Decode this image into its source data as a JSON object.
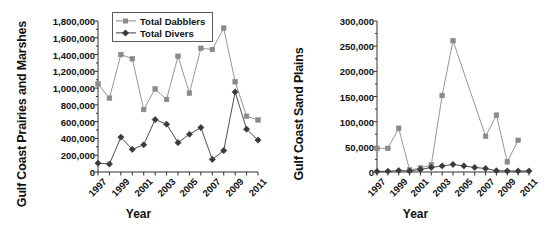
{
  "figure": {
    "panels": [
      {
        "id": "gulf-coast-prairies-and-marshes",
        "ylabel": "Gulf Coast Prairies and Marshes",
        "xlabel": "Year"
      },
      {
        "id": "gulf-coast-sand-plains",
        "ylabel": "Gulf Coast Sand Plains",
        "xlabel": "Year"
      }
    ],
    "legend": {
      "position": "top-left-inside-left-panel",
      "entries": [
        {
          "label": "Total Dabblers",
          "color": "#8a8a8a"
        },
        {
          "label": "Total Divers",
          "color": "#3a3a3a"
        }
      ]
    }
  },
  "chart_data": [
    {
      "type": "line",
      "title": "",
      "xlabel": "Year",
      "ylabel": "Gulf Coast Prairies and Marshes",
      "x": [
        1997,
        1998,
        1999,
        2000,
        2001,
        2002,
        2003,
        2004,
        2005,
        2006,
        2007,
        2008,
        2009,
        2010,
        2011
      ],
      "xtick_labels": [
        "1997",
        "",
        "1999",
        "",
        "2001",
        "",
        "2003",
        "",
        "2005",
        "",
        "2007",
        "",
        "2009",
        "",
        "2011"
      ],
      "xlim": [
        1997,
        2011
      ],
      "ylim": [
        0,
        1800000
      ],
      "ytick_labels": [
        "0",
        "200,000",
        "400,000",
        "600,000",
        "800,000",
        "1,000,000",
        "1,200,000",
        "1,400,000",
        "1,600,000",
        "1,800,000"
      ],
      "yticks": [
        0,
        200000,
        400000,
        600000,
        800000,
        1000000,
        1200000,
        1400000,
        1600000,
        1800000
      ],
      "grid": false,
      "legend_position": "upper left",
      "series": [
        {
          "name": "Total Dabblers",
          "color": "#8a8a8a",
          "marker": "square",
          "values": [
            1050000,
            880000,
            1400000,
            1350000,
            745000,
            990000,
            865000,
            1380000,
            940000,
            1475000,
            1460000,
            1715000,
            1075000,
            665000,
            620000
          ]
        },
        {
          "name": "Total Divers",
          "color": "#3a3a3a",
          "marker": "diamond",
          "values": [
            105000,
            95000,
            415000,
            270000,
            325000,
            625000,
            570000,
            350000,
            450000,
            530000,
            150000,
            255000,
            955000,
            510000,
            380000
          ]
        }
      ]
    },
    {
      "type": "line",
      "title": "",
      "xlabel": "Year",
      "ylabel": "Gulf Coast Sand Plains",
      "x": [
        1997,
        1998,
        1999,
        2000,
        2001,
        2002,
        2003,
        2004,
        2005,
        2006,
        2007,
        2008,
        2009,
        2010,
        2011
      ],
      "xtick_labels": [
        "1997",
        "",
        "1999",
        "",
        "2001",
        "",
        "2003",
        "",
        "2005",
        "",
        "2007",
        "",
        "2009",
        "",
        "2011"
      ],
      "xlim": [
        1997,
        2011
      ],
      "ylim": [
        0,
        300000
      ],
      "ytick_labels": [
        "0",
        "50,000",
        "100,000",
        "150,000",
        "200,000",
        "250,000",
        "300,000"
      ],
      "yticks": [
        0,
        50000,
        100000,
        150000,
        200000,
        250000,
        300000
      ],
      "grid": false,
      "legend_position": "none",
      "series": [
        {
          "name": "Total Dabblers",
          "color": "#8a8a8a",
          "marker": "square",
          "values": [
            47000,
            47000,
            87000,
            4000,
            8000,
            14000,
            152000,
            261000,
            null,
            null,
            71000,
            113000,
            20000,
            63000,
            null
          ]
        },
        {
          "name": "Total Divers",
          "color": "#3a3a3a",
          "marker": "diamond",
          "values": [
            1000,
            1500,
            3000,
            2000,
            5000,
            9000,
            12000,
            15000,
            12000,
            9000,
            7000,
            2500,
            2000,
            2000,
            2000
          ]
        }
      ]
    }
  ]
}
